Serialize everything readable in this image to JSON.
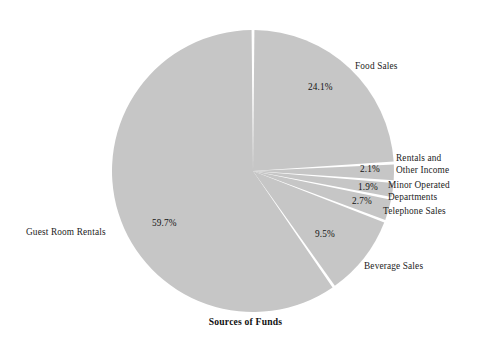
{
  "chart_data": {
    "type": "pie",
    "title": "Sources of Funds",
    "xlabel": "",
    "ylabel": "",
    "legend_position": "none",
    "grid": false,
    "units": "percent",
    "start_angle_deg": 0,
    "direction": "clockwise",
    "slice_color": "#c6c6c6",
    "separator_color": "#ffffff",
    "background_color": "#ffffff",
    "categories": [
      "Food Sales",
      "Rentals and Other Income",
      "Minor Operated Departments",
      "Telephone Sales",
      "Beverage Sales",
      "Guest Room Rentals"
    ],
    "values": [
      24.1,
      2.1,
      1.9,
      2.7,
      9.5,
      59.7
    ],
    "labels": [
      "24.1%",
      "2.1%",
      "1.9%",
      "2.7%",
      "9.5%",
      "59.7%"
    ]
  },
  "title": {
    "text": "Sources of Funds"
  },
  "slices": [
    {
      "name": "food-sales",
      "label": "Food Sales",
      "label_line1": "Food Sales",
      "label_line2": "",
      "percent_text": "24.1%",
      "value": 24.1
    },
    {
      "name": "rentals-and-other-income",
      "label": "Rentals and Other Income",
      "label_line1": "Rentals and",
      "label_line2": "Other Income",
      "percent_text": "2.1%",
      "value": 2.1
    },
    {
      "name": "minor-operated-departments",
      "label": "Minor Operated Departments",
      "label_line1": "Minor Operated",
      "label_line2": "Departments",
      "percent_text": "1.9%",
      "value": 1.9
    },
    {
      "name": "telephone-sales",
      "label": "Telephone Sales",
      "label_line1": "Telephone Sales",
      "label_line2": "",
      "percent_text": "2.7%",
      "value": 2.7
    },
    {
      "name": "beverage-sales",
      "label": "Beverage Sales",
      "label_line1": "Beverage Sales",
      "label_line2": "",
      "percent_text": "9.5%",
      "value": 9.5
    },
    {
      "name": "guest-room-rentals",
      "label": "Guest Room Rentals",
      "label_line1": "Guest Room Rentals",
      "label_line2": "",
      "percent_text": "59.7%",
      "value": 59.7
    }
  ],
  "geometry": {
    "center_x": 253,
    "center_y": 171,
    "radius": 141,
    "gap_deg": 1.15
  }
}
